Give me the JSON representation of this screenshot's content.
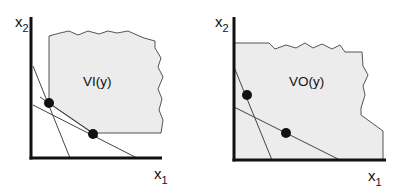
{
  "colors": {
    "axis": "#111111",
    "region_fill": "#ececec",
    "region_stroke": "#555555",
    "line": "#444444",
    "dot": "#111111",
    "background": "#ffffff"
  },
  "panels": [
    {
      "id": "left",
      "region_label": "VI(y)",
      "x_axis": {
        "label": "x",
        "subscript": "1"
      },
      "y_axis": {
        "label": "x",
        "subscript": "2"
      },
      "region_points": "49,103 49,36 60,33 69,31 78,35 88,31 99,34 108,31 117,33 128,31 137,35 144,38 155,41 155,48 161,58 158,67 163,77 158,89 162,99 159,110 163,120 161,133 93,133",
      "dots": [
        {
          "cx": 49,
          "cy": 103
        },
        {
          "cx": 93,
          "cy": 134
        }
      ],
      "lines": [
        {
          "x1": 33,
          "y1": 66,
          "x2": 70,
          "y2": 158
        },
        {
          "x1": 33,
          "y1": 105,
          "x2": 137,
          "y2": 158
        },
        {
          "x1": 40,
          "y1": 97,
          "x2": 98,
          "y2": 137
        }
      ],
      "axes": {
        "origin_x": 31,
        "origin_y": 158,
        "top_y": 17,
        "right_x": 162
      },
      "label_positions": {
        "y_label": {
          "x": 15,
          "y": 27
        },
        "x_label": {
          "x": 154,
          "y": 179
        },
        "region": {
          "x": 83,
          "y": 86
        }
      }
    },
    {
      "id": "right",
      "region_label": "VO(y)",
      "x_axis": {
        "label": "x",
        "subscript": "1"
      },
      "y_axis": {
        "label": "x",
        "subscript": "2"
      },
      "region_points": "234,43 269,43 275,49 286,45 296,48 305,43 313,48 322,44 332,49 340,45 345,52 362,52 363,66 368,75 363,86 365,95 361,108 361,115 383,131 383,160 234,160",
      "dots": [
        {
          "cx": 247,
          "cy": 95
        },
        {
          "cx": 286,
          "cy": 133
        }
      ],
      "lines": [
        {
          "x1": 234,
          "y1": 67,
          "x2": 272,
          "y2": 160
        },
        {
          "x1": 234,
          "y1": 107,
          "x2": 340,
          "y2": 160
        }
      ],
      "axes": {
        "origin_x": 234,
        "origin_y": 160,
        "top_y": 17,
        "right_x": 386
      },
      "label_positions": {
        "y_label": {
          "x": 215,
          "y": 27
        },
        "x_label": {
          "x": 368,
          "y": 181
        },
        "region": {
          "x": 289,
          "y": 86
        }
      }
    }
  ]
}
